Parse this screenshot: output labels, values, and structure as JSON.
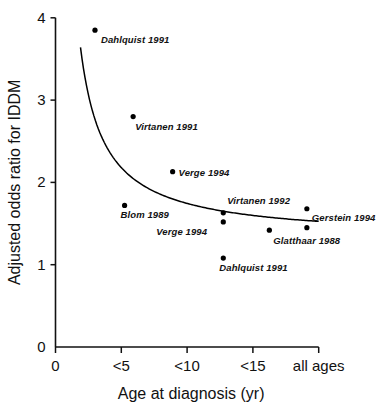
{
  "chart_data": {
    "type": "scatter",
    "title": "",
    "xlabel": "Age at diagnosis (yr)",
    "ylabel": "Adjusted odds ratio for IDDM",
    "x_tick_labels": [
      "0",
      "<5",
      "<10",
      "<15",
      "all ages"
    ],
    "x_tick_positions": [
      0,
      1,
      2,
      3,
      4
    ],
    "y_tick_labels": [
      "0",
      "1",
      "2",
      "3",
      "4"
    ],
    "y_ticks": [
      0,
      1,
      2,
      3,
      4
    ],
    "ylim": [
      0,
      4
    ],
    "xlim": [
      0,
      4.1
    ],
    "grid": false,
    "legend": null,
    "points": [
      {
        "label": "Dahlquist 1991",
        "x": 0.6,
        "y": 3.85,
        "label_dx": 6,
        "label_dy": 13
      },
      {
        "label": "Virtanen 1991",
        "x": 1.18,
        "y": 2.8,
        "label_dx": 2,
        "label_dy": 13
      },
      {
        "label": "Verge 1994",
        "x": 1.78,
        "y": 2.13,
        "label_dx": 6,
        "label_dy": 4
      },
      {
        "label": "Blom 1989",
        "x": 1.05,
        "y": 1.72,
        "label_dx": -4,
        "label_dy": 13
      },
      {
        "label": "Virtanen 1992",
        "x": 2.55,
        "y": 1.63,
        "label_dx": 4,
        "label_dy": -9
      },
      {
        "label": "Verge 1994",
        "x": 2.55,
        "y": 1.52,
        "label_dx": -67,
        "label_dy": 13
      },
      {
        "label": "Glatthaar 1988",
        "x": 3.25,
        "y": 1.42,
        "label_dx": 4,
        "label_dy": 14
      },
      {
        "label": "Gerstein 1994",
        "x": 3.82,
        "y": 1.68,
        "label_dx": 5,
        "label_dy": 12
      },
      {
        "label": "",
        "x": 3.82,
        "y": 1.45,
        "label_dx": 0,
        "label_dy": 0
      },
      {
        "label": "Dahlquist 1991",
        "x": 2.55,
        "y": 1.08,
        "label_dx": -4,
        "label_dy": 13
      }
    ],
    "fit_curve": {
      "description": "decreasing hyperbolic fit",
      "x_start": 0.38,
      "x_end": 4.0,
      "y_start": 3.64,
      "y_end": 1.45
    },
    "colors": {
      "axis": "#111111",
      "marker": "#000000",
      "curve": "#000000",
      "background": "#ffffff"
    }
  }
}
